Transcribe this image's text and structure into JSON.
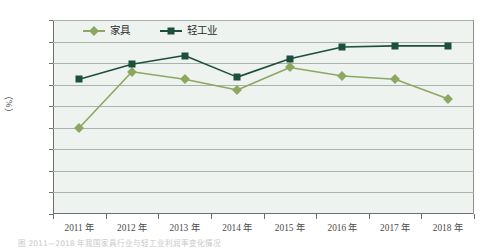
{
  "chart_data": {
    "type": "line",
    "title": "",
    "xlabel": "",
    "ylabel": "（%）",
    "categories": [
      "2011 年",
      "2012 年",
      "2013 年",
      "2014 年",
      "2015 年",
      "2016 年",
      "2017 年",
      "2018 年"
    ],
    "ylim": [
      5,
      6.8
    ],
    "ytick_labels": [
      "6.8",
      "6.6",
      "6.4",
      "6.2",
      "6",
      "5.8",
      "5.6",
      "5.4",
      "5.2",
      "5"
    ],
    "ytick_values": [
      6.8,
      6.6,
      6.4,
      6.2,
      6.0,
      5.8,
      5.6,
      5.4,
      5.2,
      5.0
    ],
    "grid": true,
    "legend_position": "top-left",
    "series": [
      {
        "name": "家具",
        "color": "#8ca860",
        "marker": "diamond",
        "values": [
          5.8,
          6.32,
          6.25,
          6.15,
          6.36,
          6.28,
          6.25,
          6.07
        ]
      },
      {
        "name": "轻工业",
        "color": "#1d4f3f",
        "marker": "square",
        "values": [
          6.25,
          6.39,
          6.47,
          6.27,
          6.44,
          6.55,
          6.56,
          6.56
        ]
      }
    ]
  },
  "caption": {
    "text": "图  2011—2018 年我国家具行业与轻工业利润率变化情况"
  },
  "colors": {
    "plot_background": "#eef3ef",
    "gridline": "#a8b3ab",
    "axis": "#6e6e6e",
    "series_furniture": "#8ca860",
    "series_light_industry": "#1d4f3f"
  }
}
